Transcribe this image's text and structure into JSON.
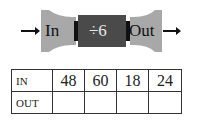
{
  "machine": {
    "input_label": "In",
    "operation_label": "÷6",
    "output_label": "Out",
    "input_arrow_icon": "arrow-right",
    "output_arrow_icon": "arrow-right",
    "colors": {
      "funnel": "#a8a8a8",
      "operation_box": "#4a4a4a",
      "connector": "#111111",
      "operation_text": "#e8e8e8"
    }
  },
  "table": {
    "rows": [
      {
        "header": "IN",
        "values": [
          "48",
          "60",
          "18",
          "24"
        ]
      },
      {
        "header": "OUT",
        "values": [
          "",
          "",
          "",
          ""
        ]
      }
    ]
  }
}
